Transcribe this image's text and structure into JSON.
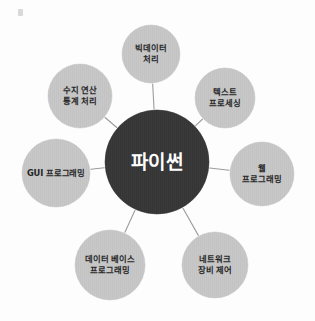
{
  "diagram": {
    "title_text": "파이썬",
    "type": "radial-hub-and-spoke",
    "background_color": "#fdfdfd",
    "center": {
      "name": "python-center",
      "label": "파이썬",
      "cx": 157,
      "cy": 162,
      "r": 52,
      "fill": "#3a3a3a",
      "text_color": "#ffffff"
    },
    "node_fill": "#c8c8c8",
    "edge_color": "#9c9c9c",
    "node_text_color": "#262626",
    "nodes": [
      {
        "name": "node-bigdata",
        "lines": [
          "빅데이터",
          "처리"
        ],
        "cx": 151,
        "cy": 54,
        "r": 29
      },
      {
        "name": "node-text-processing",
        "lines": [
          "텍스트",
          "프로세싱"
        ],
        "cx": 225,
        "cy": 98,
        "r": 30
      },
      {
        "name": "node-web-programming",
        "lines": [
          "웹",
          "프로그래밍"
        ],
        "cx": 262,
        "cy": 174,
        "r": 32
      },
      {
        "name": "node-network-control",
        "lines": [
          "네트워크",
          "장비 제어"
        ],
        "cx": 215,
        "cy": 265,
        "r": 33
      },
      {
        "name": "node-database-programming",
        "lines": [
          "데이터 베이스",
          "프로그래밍"
        ],
        "cx": 110,
        "cy": 265,
        "r": 35
      },
      {
        "name": "node-gui-programming",
        "lines": [
          "GUI 프로그래밍"
        ],
        "cx": 56,
        "cy": 173,
        "r": 34
      },
      {
        "name": "node-numeric-statistics",
        "lines": [
          "수지 연산",
          "통계 처리"
        ],
        "cx": 80,
        "cy": 96,
        "r": 32
      }
    ]
  }
}
